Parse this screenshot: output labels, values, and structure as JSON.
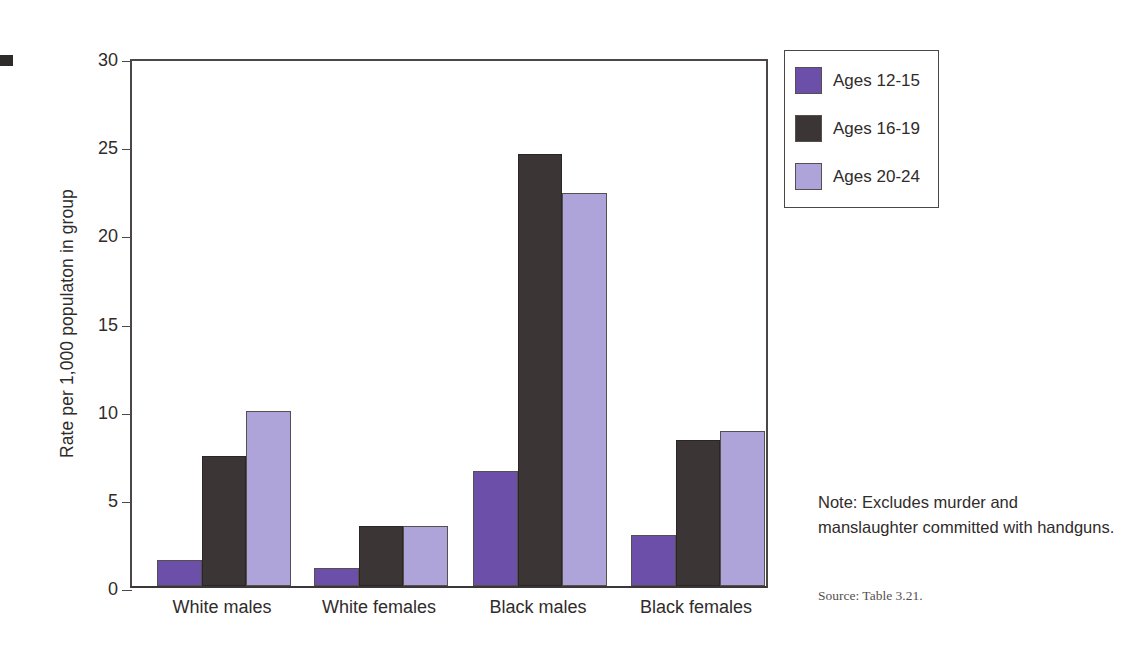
{
  "chart_data": {
    "type": "bar",
    "title": "",
    "xlabel": "",
    "ylabel": "Rate per 1,000 populaton in group",
    "ylim": [
      0,
      30
    ],
    "yticks": [
      0,
      5,
      10,
      15,
      20,
      25,
      30
    ],
    "grid": false,
    "legend_position": "top-right",
    "categories": [
      "White males",
      "White females",
      "Black males",
      "Black females"
    ],
    "series": [
      {
        "name": "Ages 12-15",
        "color": "#6b4fa8",
        "values": [
          1.5,
          1.0,
          6.5,
          2.9
        ]
      },
      {
        "name": "Ages 16-19",
        "color": "#3b3635",
        "values": [
          7.4,
          3.4,
          24.5,
          8.3
        ]
      },
      {
        "name": "Ages 20-24",
        "color": "#aea4d9",
        "values": [
          9.9,
          3.4,
          22.3,
          8.8
        ]
      }
    ],
    "note": "Note: Excludes murder and manslaughter committed with handguns.",
    "source": "Source: Table 3.21."
  },
  "axis": {
    "y_title": "Rate per 1,000 populaton in group",
    "tick_labels": [
      "0",
      "5",
      "10",
      "15",
      "20",
      "25",
      "30"
    ]
  },
  "legend": {
    "items": [
      {
        "label": "Ages 12-15"
      },
      {
        "label": "Ages 16-19"
      },
      {
        "label": "Ages 20-24"
      }
    ]
  },
  "annotations": {
    "note": "Note: Excludes murder and manslaughter committed with handguns.",
    "source": "Source: Table 3.21."
  }
}
